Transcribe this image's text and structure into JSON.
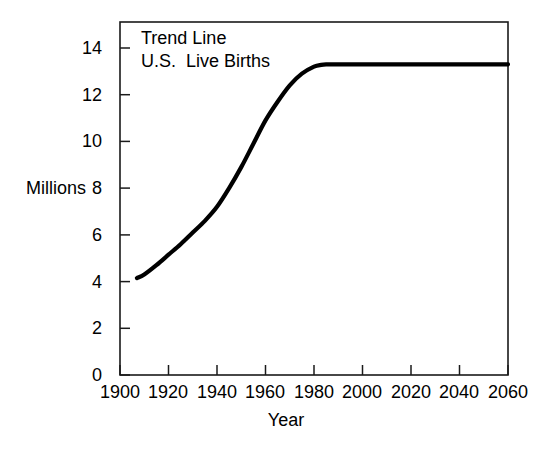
{
  "chart_data": {
    "type": "line",
    "title": "Trend Line",
    "subtitle": "U.S.  Live Births",
    "xlabel": "Year",
    "ylabel": "Millions",
    "xlim": [
      1900,
      2060
    ],
    "ylim": [
      0,
      14
    ],
    "grid": false,
    "legend": "none",
    "annotations": [
      "Trend Line",
      "U.S.  Live Births"
    ],
    "xticks": [
      1900,
      1920,
      1940,
      1960,
      1980,
      2000,
      2020,
      2040,
      2060
    ],
    "yticks": [
      0,
      2,
      4,
      6,
      8,
      10,
      12,
      14
    ],
    "xtick_labels": [
      "1900",
      "1920",
      "1940",
      "1960",
      "1980",
      "2000",
      "2020",
      "2040",
      "2060"
    ],
    "ytick_labels": [
      "0",
      "2",
      "4",
      "6",
      "8",
      "10",
      "12",
      "14"
    ],
    "series": [
      {
        "name": "U.S. Live Births trend line",
        "color": "#000000",
        "x": [
          1907,
          1910,
          1915,
          1920,
          1925,
          1930,
          1935,
          1940,
          1945,
          1950,
          1955,
          1960,
          1965,
          1970,
          1975,
          1980,
          1983,
          1985,
          1990,
          2000,
          2010,
          2020,
          2030,
          2040,
          2050,
          2060
        ],
        "y": [
          4.15,
          4.3,
          4.7,
          5.15,
          5.6,
          6.1,
          6.6,
          7.2,
          8.0,
          8.9,
          9.9,
          10.9,
          11.7,
          12.4,
          12.9,
          13.2,
          13.28,
          13.3,
          13.3,
          13.3,
          13.3,
          13.3,
          13.3,
          13.3,
          13.3,
          13.3
        ]
      }
    ],
    "plateau_value": 13.3,
    "start_value": 4.15
  },
  "axes": {
    "y_title": "Millions",
    "x_title": "Year"
  }
}
